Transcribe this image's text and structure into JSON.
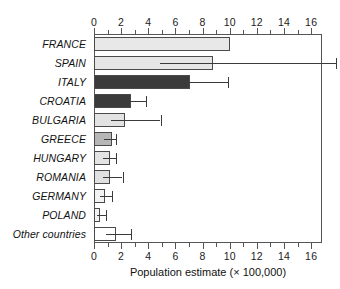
{
  "chart_data": {
    "type": "bar",
    "orientation": "horizontal",
    "title": "",
    "xlabel": "Population estimate (× 100,000)",
    "ylabel": "",
    "xlim": [
      0,
      16.8
    ],
    "grid": false,
    "legend": null,
    "xticks": [
      0,
      2,
      4,
      6,
      8,
      10,
      12,
      14,
      16
    ],
    "xtick_labels": [
      "0",
      "2",
      "4",
      "6",
      "8",
      "10",
      "12",
      "14",
      "16"
    ],
    "minor_tick_step": 1,
    "axis_positions": [
      "top",
      "bottom"
    ],
    "categories": [
      "FRANCE",
      "SPAIN",
      "ITALY",
      "CROATIA",
      "BULGARIA",
      "GREECE",
      "HUNGARY",
      "ROMANIA",
      "GERMANY",
      "POLAND",
      "Other countries"
    ],
    "values": [
      10.0,
      8.8,
      7.1,
      2.7,
      2.3,
      1.3,
      1.2,
      1.2,
      0.8,
      0.45,
      1.6
    ],
    "error_high": [
      null,
      17.8,
      9.9,
      3.8,
      4.9,
      1.6,
      1.6,
      2.1,
      1.3,
      0.9,
      2.7
    ],
    "bar_colors": [
      "#e8e8e8",
      "#e6e6e6",
      "#3b3b3b",
      "#3b3b3b",
      "#e3e3e3",
      "#b6b6b6",
      "#e3e3e3",
      "#e0e0e0",
      "#f2f2f2",
      "#f2f2f2",
      "#ffffff"
    ],
    "bar_edge_color": "#4a4a4a",
    "error_color": "#3b3b3b"
  }
}
